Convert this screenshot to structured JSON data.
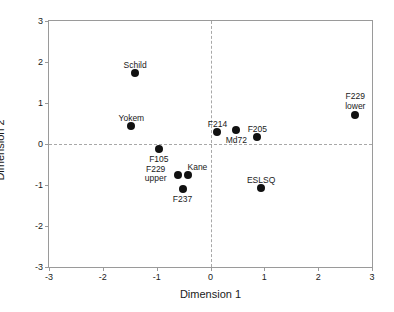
{
  "chart_data": {
    "type": "scatter",
    "title": "",
    "xlabel": "Dimension 1",
    "ylabel": "Dimension 2",
    "xlim": [
      -3,
      3
    ],
    "ylim": [
      -3,
      3
    ],
    "xticks": [
      "-3",
      "-2",
      "-1",
      "0",
      "1",
      "2",
      "3"
    ],
    "xtick_values": [
      -3,
      -2,
      -1,
      0,
      1,
      2,
      3
    ],
    "yticks": [
      "-3",
      "-2",
      "-1",
      "0",
      "1",
      "2",
      "3"
    ],
    "ytick_values": [
      -3,
      -2,
      -1,
      0,
      1,
      2,
      3
    ],
    "grid": false,
    "legend": "none",
    "reference_lines": [
      {
        "axis": "vertical",
        "value": 0,
        "style": "dashed"
      },
      {
        "axis": "horizontal",
        "value": 0,
        "style": "dashed"
      }
    ],
    "marker": {
      "shape": "circle",
      "color": "#111111",
      "size": 8
    },
    "points": [
      {
        "label": "Schild",
        "x": -1.4,
        "y": 1.73,
        "label_dx": 0,
        "label_dy": -12,
        "align": "center"
      },
      {
        "label": "Yokem",
        "x": -1.47,
        "y": 0.45,
        "label_dx": 0,
        "label_dy": -12,
        "align": "center"
      },
      {
        "label": "F229\nlower",
        "x": 2.69,
        "y": 0.7,
        "label_dx": 0,
        "label_dy": -23,
        "align": "center"
      },
      {
        "label": "F214",
        "x": 0.13,
        "y": 0.29,
        "label_dx": 0,
        "label_dy": -12,
        "align": "center"
      },
      {
        "label": "Md72",
        "x": 0.48,
        "y": 0.34,
        "label_dx": 0,
        "label_dy": 6,
        "align": "center"
      },
      {
        "label": "F205",
        "x": 0.87,
        "y": 0.16,
        "label_dx": 0,
        "label_dy": -12,
        "align": "center"
      },
      {
        "label": "F105",
        "x": -0.96,
        "y": -0.12,
        "label_dx": 0,
        "label_dy": 6,
        "align": "center"
      },
      {
        "label": "F229\nupper",
        "x": -0.61,
        "y": -0.75,
        "label_dx": -22,
        "label_dy": -10,
        "align": "center"
      },
      {
        "label": "Kane",
        "x": -0.41,
        "y": -0.75,
        "label_dx": 9,
        "label_dy": -12,
        "align": "center"
      },
      {
        "label": "F237",
        "x": -0.52,
        "y": -1.09,
        "label_dx": 0,
        "label_dy": 6,
        "align": "center"
      },
      {
        "label": "ESLSQ",
        "x": 0.94,
        "y": -1.07,
        "label_dx": 0,
        "label_dy": -12,
        "align": "center"
      }
    ]
  }
}
